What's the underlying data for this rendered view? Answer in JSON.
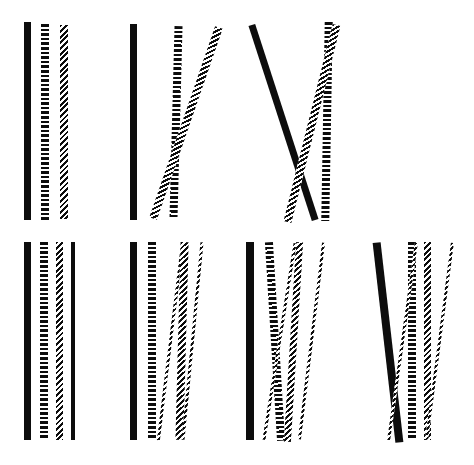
{
  "figure": {
    "title": "",
    "background_color": "#ffffff",
    "ink_color": "#0d0d0d",
    "width": 474,
    "height": 465,
    "texture_names": [
      "solid",
      "horizontal-stripe",
      "diagonal-hatch"
    ],
    "rows": [
      {
        "name": "top-row",
        "panel_count": 3
      },
      {
        "name": "bottom-row",
        "panel_count": 4
      }
    ]
  },
  "panels": [
    {
      "id": "panel-1",
      "row": "top-row",
      "index": 1,
      "left": 0,
      "top": 0,
      "width": 120,
      "height": 232,
      "bar_count": 3,
      "bars": [
        {
          "name": "bar-1",
          "texture": "solid",
          "x": 24,
          "y": 22,
          "w": 7,
          "h": 198,
          "angle": 0.0
        },
        {
          "name": "bar-2",
          "texture": "stripe",
          "x": 41,
          "y": 24,
          "w": 8,
          "h": 196,
          "angle": 0.0
        },
        {
          "name": "bar-3",
          "texture": "hatch",
          "x": 60,
          "y": 25,
          "w": 8,
          "h": 194,
          "angle": 0.0
        }
      ]
    },
    {
      "id": "panel-2",
      "row": "top-row",
      "index": 2,
      "left": 120,
      "top": 0,
      "width": 120,
      "height": 232,
      "bar_count": 3,
      "bars": [
        {
          "name": "bar-1",
          "texture": "solid",
          "x": 10,
          "y": 24,
          "w": 7,
          "h": 196,
          "angle": 0.0
        },
        {
          "name": "bar-2",
          "texture": "stripe",
          "x": 52,
          "y": 26,
          "w": 8,
          "h": 193,
          "angle": 1.5
        },
        {
          "name": "bar-3",
          "texture": "hatch",
          "x": 62,
          "y": 22,
          "w": 8,
          "h": 202,
          "angle": 19.0
        }
      ]
    },
    {
      "id": "panel-3",
      "row": "top-row",
      "index": 3,
      "left": 240,
      "top": 0,
      "width": 120,
      "height": 232,
      "bar_count": 3,
      "bars": [
        {
          "name": "bar-1",
          "texture": "solid",
          "x": 40,
          "y": 20,
          "w": 7,
          "h": 205,
          "angle": -18.0
        },
        {
          "name": "bar-2",
          "texture": "stripe",
          "x": 83,
          "y": 22,
          "w": 8,
          "h": 199,
          "angle": 1.0
        },
        {
          "name": "bar-3",
          "texture": "hatch",
          "x": 68,
          "y": 22,
          "w": 8,
          "h": 203,
          "angle": 14.0
        }
      ]
    },
    {
      "id": "panel-4",
      "row": "bottom-row",
      "index": 1,
      "left": 0,
      "top": 232,
      "width": 118,
      "height": 233,
      "bar_count": 4,
      "bars": [
        {
          "name": "bar-1",
          "texture": "solid",
          "x": 24,
          "y": 10,
          "w": 7,
          "h": 198,
          "angle": 0.0
        },
        {
          "name": "bar-2",
          "texture": "stripe",
          "x": 40,
          "y": 10,
          "w": 8,
          "h": 198,
          "angle": 0.0
        },
        {
          "name": "bar-3",
          "texture": "hatch",
          "x": 56,
          "y": 10,
          "w": 7,
          "h": 198,
          "angle": 0.0
        },
        {
          "name": "bar-4",
          "texture": "solid",
          "x": 71,
          "y": 10,
          "w": 4,
          "h": 198,
          "angle": 0.0
        }
      ]
    },
    {
      "id": "panel-5",
      "row": "bottom-row",
      "index": 2,
      "left": 118,
      "top": 232,
      "width": 120,
      "height": 233,
      "bar_count": 4,
      "bars": [
        {
          "name": "bar-1",
          "texture": "solid",
          "x": 12,
          "y": 10,
          "w": 7,
          "h": 198,
          "angle": 0.0
        },
        {
          "name": "bar-2",
          "texture": "stripe",
          "x": 30,
          "y": 10,
          "w": 8,
          "h": 198,
          "angle": 0.0
        },
        {
          "name": "bar-3",
          "texture": "hatch",
          "x": 51,
          "y": 10,
          "w": 3,
          "h": 199,
          "angle": 7.0
        },
        {
          "name": "bar-4",
          "texture": "hatch",
          "x": 60,
          "y": 10,
          "w": 8,
          "h": 198,
          "angle": 1.5
        },
        {
          "name": "bar-5",
          "texture": "hatch",
          "x": 73,
          "y": 10,
          "w": 3,
          "h": 198,
          "angle": 5.5
        }
      ]
    },
    {
      "id": "panel-6",
      "row": "bottom-row",
      "index": 3,
      "left": 238,
      "top": 232,
      "width": 118,
      "height": 233,
      "bar_count": 4,
      "bars": [
        {
          "name": "bar-1",
          "texture": "solid",
          "x": 8,
          "y": 10,
          "w": 8,
          "h": 198,
          "angle": 0.0
        },
        {
          "name": "bar-2",
          "texture": "stripe",
          "x": 33,
          "y": 10,
          "w": 8,
          "h": 199,
          "angle": -3.5
        },
        {
          "name": "bar-3",
          "texture": "hatch",
          "x": 52,
          "y": 10,
          "w": 7,
          "h": 200,
          "angle": 3.5
        },
        {
          "name": "bar-4",
          "texture": "hatch",
          "x": 40,
          "y": 10,
          "w": 3,
          "h": 199,
          "angle": 9.0
        },
        {
          "name": "bar-5",
          "texture": "hatch",
          "x": 72,
          "y": 10,
          "w": 3,
          "h": 198,
          "angle": 7.0
        }
      ]
    },
    {
      "id": "panel-7",
      "row": "bottom-row",
      "index": 4,
      "left": 356,
      "top": 232,
      "width": 118,
      "height": 233,
      "bar_count": 4,
      "bars": [
        {
          "name": "bar-1",
          "texture": "solid",
          "x": 28,
          "y": 10,
          "w": 8,
          "h": 201,
          "angle": -6.5
        },
        {
          "name": "bar-2",
          "texture": "stripe",
          "x": 52,
          "y": 10,
          "w": 8,
          "h": 198,
          "angle": 0.0
        },
        {
          "name": "bar-3",
          "texture": "hatch",
          "x": 68,
          "y": 10,
          "w": 7,
          "h": 198,
          "angle": 0.0
        },
        {
          "name": "bar-4",
          "texture": "hatch",
          "x": 45,
          "y": 10,
          "w": 3,
          "h": 199,
          "angle": 8.0
        },
        {
          "name": "bar-5",
          "texture": "hatch",
          "x": 82,
          "y": 10,
          "w": 3,
          "h": 198,
          "angle": 7.5
        }
      ]
    }
  ]
}
